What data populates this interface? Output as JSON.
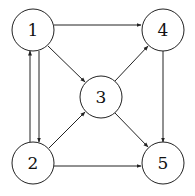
{
  "diagram": {
    "type": "directed-graph",
    "nodes": [
      {
        "id": "1",
        "label": "1",
        "x": 33,
        "y": 30
      },
      {
        "id": "2",
        "label": "2",
        "x": 33,
        "y": 163
      },
      {
        "id": "3",
        "label": "3",
        "x": 101,
        "y": 97
      },
      {
        "id": "4",
        "label": "4",
        "x": 163,
        "y": 30
      },
      {
        "id": "5",
        "label": "5",
        "x": 163,
        "y": 163
      }
    ],
    "edges": [
      {
        "from": "1",
        "to": "4"
      },
      {
        "from": "1",
        "to": "3"
      },
      {
        "from": "1",
        "to": "2"
      },
      {
        "from": "2",
        "to": "1"
      },
      {
        "from": "2",
        "to": "3"
      },
      {
        "from": "2",
        "to": "5"
      },
      {
        "from": "3",
        "to": "4"
      },
      {
        "from": "3",
        "to": "5"
      },
      {
        "from": "4",
        "to": "5"
      }
    ]
  },
  "colors": {
    "stroke": "#222222",
    "background": "#ffffff"
  }
}
